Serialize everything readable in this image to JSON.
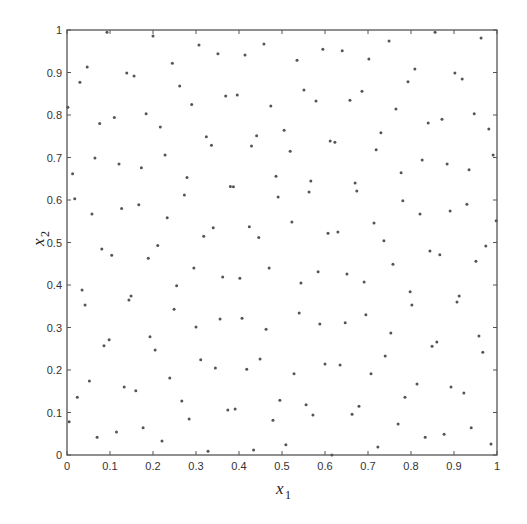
{
  "chart_data": {
    "type": "scatter",
    "title": "",
    "xlabel": "x1",
    "ylabel": "x2",
    "xlabel_main": "x",
    "xlabel_sub": "1",
    "ylabel_main": "x",
    "ylabel_sub": "2",
    "xlim": [
      0,
      1
    ],
    "ylim": [
      0,
      1
    ],
    "grid": false,
    "legend": null,
    "xticks": [
      "0",
      "0.1",
      "0.2",
      "0.3",
      "0.4",
      "0.5",
      "0.6",
      "0.7",
      "0.8",
      "0.9",
      "1"
    ],
    "yticks": [
      "0",
      "0.1",
      "0.2",
      "0.3",
      "0.4",
      "0.5",
      "0.6",
      "0.7",
      "0.8",
      "0.9",
      "1"
    ],
    "marker": "*",
    "marker_color": "#555555",
    "points": [
      [
        0.093,
        0.995
      ],
      [
        0.2,
        0.986
      ],
      [
        0.307,
        0.965
      ],
      [
        0.351,
        0.944
      ],
      [
        0.414,
        0.941
      ],
      [
        0.047,
        0.913
      ],
      [
        0.245,
        0.922
      ],
      [
        0.139,
        0.899
      ],
      [
        0.156,
        0.892
      ],
      [
        0.03,
        0.877
      ],
      [
        0.262,
        0.868
      ],
      [
        0.369,
        0.845
      ],
      [
        0.396,
        0.847
      ],
      [
        0.002,
        0.818
      ],
      [
        0.29,
        0.825
      ],
      [
        0.184,
        0.803
      ],
      [
        0.11,
        0.794
      ],
      [
        0.076,
        0.78
      ],
      [
        0.217,
        0.772
      ],
      [
        0.324,
        0.749
      ],
      [
        0.441,
        0.751
      ],
      [
        0.336,
        0.729
      ],
      [
        0.429,
        0.727
      ],
      [
        0.228,
        0.706
      ],
      [
        0.065,
        0.699
      ],
      [
        0.173,
        0.676
      ],
      [
        0.121,
        0.685
      ],
      [
        0.013,
        0.662
      ],
      [
        0.279,
        0.653
      ],
      [
        0.38,
        0.632
      ],
      [
        0.387,
        0.631
      ],
      [
        0.273,
        0.612
      ],
      [
        0.018,
        0.603
      ],
      [
        0.167,
        0.589
      ],
      [
        0.127,
        0.58
      ],
      [
        0.058,
        0.567
      ],
      [
        0.233,
        0.558
      ],
      [
        0.34,
        0.535
      ],
      [
        0.424,
        0.537
      ],
      [
        0.318,
        0.515
      ],
      [
        0.446,
        0.512
      ],
      [
        0.211,
        0.493
      ],
      [
        0.081,
        0.485
      ],
      [
        0.104,
        0.47
      ],
      [
        0.189,
        0.463
      ],
      [
        0.295,
        0.44
      ],
      [
        0.47,
        0.44
      ],
      [
        0.362,
        0.419
      ],
      [
        0.402,
        0.416
      ],
      [
        0.035,
        0.388
      ],
      [
        0.255,
        0.398
      ],
      [
        0.149,
        0.374
      ],
      [
        0.144,
        0.365
      ],
      [
        0.042,
        0.353
      ],
      [
        0.249,
        0.343
      ],
      [
        0.356,
        0.32
      ],
      [
        0.407,
        0.322
      ],
      [
        0.3,
        0.301
      ],
      [
        0.463,
        0.296
      ],
      [
        0.098,
        0.271
      ],
      [
        0.086,
        0.257
      ],
      [
        0.193,
        0.278
      ],
      [
        0.205,
        0.247
      ],
      [
        0.311,
        0.224
      ],
      [
        0.345,
        0.205
      ],
      [
        0.418,
        0.202
      ],
      [
        0.449,
        0.226
      ],
      [
        0.052,
        0.174
      ],
      [
        0.024,
        0.136
      ],
      [
        0.133,
        0.16
      ],
      [
        0.16,
        0.151
      ],
      [
        0.239,
        0.181
      ],
      [
        0.267,
        0.127
      ],
      [
        0.374,
        0.106
      ],
      [
        0.391,
        0.108
      ],
      [
        0.005,
        0.078
      ],
      [
        0.284,
        0.085
      ],
      [
        0.177,
        0.064
      ],
      [
        0.115,
        0.054
      ],
      [
        0.07,
        0.042
      ],
      [
        0.221,
        0.033
      ],
      [
        0.328,
        0.009
      ],
      [
        0.434,
        0.012
      ],
      [
        0.458,
        0.967
      ],
      [
        0.535,
        0.929
      ],
      [
        0.595,
        0.955
      ],
      [
        0.64,
        0.951
      ],
      [
        0.702,
        0.932
      ],
      [
        0.749,
        0.974
      ],
      [
        0.856,
        0.995
      ],
      [
        0.963,
        0.981
      ],
      [
        0.809,
        0.908
      ],
      [
        0.902,
        0.899
      ],
      [
        0.919,
        0.885
      ],
      [
        0.793,
        0.878
      ],
      [
        0.551,
        0.859
      ],
      [
        0.686,
        0.856
      ],
      [
        0.579,
        0.833
      ],
      [
        0.658,
        0.835
      ],
      [
        0.474,
        0.821
      ],
      [
        0.765,
        0.814
      ],
      [
        0.947,
        0.803
      ],
      [
        0.84,
        0.781
      ],
      [
        0.872,
        0.79
      ],
      [
        0.981,
        0.767
      ],
      [
        0.505,
        0.764
      ],
      [
        0.73,
        0.758
      ],
      [
        0.612,
        0.739
      ],
      [
        0.623,
        0.736
      ],
      [
        0.519,
        0.715
      ],
      [
        0.719,
        0.718
      ],
      [
        0.991,
        0.706
      ],
      [
        0.826,
        0.694
      ],
      [
        0.884,
        0.685
      ],
      [
        0.935,
        0.671
      ],
      [
        0.777,
        0.664
      ],
      [
        0.486,
        0.656
      ],
      [
        0.567,
        0.645
      ],
      [
        0.67,
        0.64
      ],
      [
        0.563,
        0.619
      ],
      [
        0.674,
        0.621
      ],
      [
        0.491,
        0.607
      ],
      [
        0.781,
        0.598
      ],
      [
        0.821,
        0.567
      ],
      [
        0.891,
        0.574
      ],
      [
        0.93,
        0.59
      ],
      [
        0.998,
        0.551
      ],
      [
        0.523,
        0.548
      ],
      [
        0.714,
        0.546
      ],
      [
        0.607,
        0.522
      ],
      [
        0.63,
        0.525
      ],
      [
        0.737,
        0.504
      ],
      [
        0.974,
        0.492
      ],
      [
        0.844,
        0.48
      ],
      [
        0.867,
        0.471
      ],
      [
        0.758,
        0.449
      ],
      [
        0.951,
        0.456
      ],
      [
        0.584,
        0.431
      ],
      [
        0.651,
        0.426
      ],
      [
        0.544,
        0.405
      ],
      [
        0.691,
        0.407
      ],
      [
        0.798,
        0.384
      ],
      [
        0.912,
        0.374
      ],
      [
        0.907,
        0.36
      ],
      [
        0.802,
        0.353
      ],
      [
        0.54,
        0.334
      ],
      [
        0.695,
        0.33
      ],
      [
        0.588,
        0.308
      ],
      [
        0.647,
        0.311
      ],
      [
        0.753,
        0.287
      ],
      [
        0.958,
        0.28
      ],
      [
        0.849,
        0.256
      ],
      [
        0.86,
        0.266
      ],
      [
        0.967,
        0.242
      ],
      [
        0.74,
        0.233
      ],
      [
        0.6,
        0.214
      ],
      [
        0.635,
        0.212
      ],
      [
        0.528,
        0.191
      ],
      [
        0.707,
        0.191
      ],
      [
        0.814,
        0.167
      ],
      [
        0.893,
        0.16
      ],
      [
        0.923,
        0.146
      ],
      [
        0.786,
        0.136
      ],
      [
        0.495,
        0.129
      ],
      [
        0.556,
        0.118
      ],
      [
        0.679,
        0.115
      ],
      [
        0.572,
        0.094
      ],
      [
        0.663,
        0.096
      ],
      [
        0.479,
        0.082
      ],
      [
        0.77,
        0.073
      ],
      [
        0.833,
        0.042
      ],
      [
        0.877,
        0.049
      ],
      [
        0.94,
        0.064
      ],
      [
        0.986,
        0.026
      ],
      [
        0.509,
        0.024
      ],
      [
        0.723,
        0.019
      ],
      [
        0.616,
        0.0
      ]
    ]
  }
}
